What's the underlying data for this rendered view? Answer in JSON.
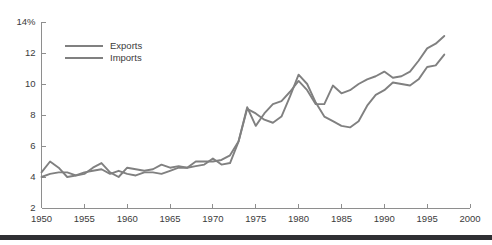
{
  "chart_data": {
    "type": "line",
    "title": "",
    "subtitle": "",
    "xlabel": "",
    "ylabel": "",
    "yunit": "%",
    "xlim": [
      1950,
      2000
    ],
    "ylim": [
      2,
      14
    ],
    "yticks": [
      2,
      4,
      6,
      8,
      10,
      12,
      14
    ],
    "ytick_labels": [
      "2",
      "4",
      "6",
      "8",
      "10",
      "12",
      "14%"
    ],
    "xticks": [
      1950,
      1955,
      1960,
      1965,
      1970,
      1975,
      1980,
      1985,
      1990,
      1995,
      2000
    ],
    "xtick_labels": [
      "1950",
      "1955",
      "1960",
      "1965",
      "1970",
      "1975",
      "1980",
      "1985",
      "1990",
      "1995",
      "2000"
    ],
    "grid": false,
    "legend_position": "top-left-inside",
    "x": [
      1950,
      1951,
      1952,
      1953,
      1954,
      1955,
      1956,
      1957,
      1958,
      1959,
      1960,
      1961,
      1962,
      1963,
      1964,
      1965,
      1966,
      1967,
      1968,
      1969,
      1970,
      1971,
      1972,
      1973,
      1974,
      1975,
      1976,
      1977,
      1978,
      1979,
      1980,
      1981,
      1982,
      1983,
      1984,
      1985,
      1986,
      1987,
      1988,
      1989,
      1990,
      1991,
      1992,
      1993,
      1994,
      1995,
      1996,
      1997
    ],
    "series": [
      {
        "name": "Exports",
        "color": "#808080",
        "values": [
          4.3,
          5.0,
          4.6,
          4.0,
          4.1,
          4.2,
          4.6,
          4.9,
          4.3,
          4.0,
          4.6,
          4.5,
          4.4,
          4.5,
          4.8,
          4.6,
          4.7,
          4.6,
          4.7,
          4.8,
          5.2,
          4.8,
          4.9,
          6.3,
          8.4,
          8.1,
          7.7,
          7.5,
          7.9,
          9.2,
          10.6,
          10.0,
          8.8,
          7.9,
          7.6,
          7.3,
          7.2,
          7.6,
          8.6,
          9.3,
          9.6,
          10.1,
          10.0,
          9.9,
          10.3,
          11.1,
          11.2,
          11.9
        ]
      },
      {
        "name": "Imports",
        "color": "#808080",
        "values": [
          4.0,
          4.2,
          4.3,
          4.3,
          4.1,
          4.3,
          4.4,
          4.5,
          4.2,
          4.4,
          4.2,
          4.1,
          4.3,
          4.3,
          4.2,
          4.4,
          4.6,
          4.6,
          5.0,
          5.0,
          5.0,
          5.1,
          5.4,
          6.3,
          8.5,
          7.3,
          8.1,
          8.7,
          8.9,
          9.5,
          10.2,
          9.6,
          8.7,
          8.7,
          9.9,
          9.4,
          9.6,
          10.0,
          10.3,
          10.5,
          10.8,
          10.4,
          10.5,
          10.8,
          11.5,
          12.3,
          12.6,
          13.1
        ]
      }
    ]
  },
  "legend": {
    "items": [
      {
        "label": "Exports"
      },
      {
        "label": "Imports"
      }
    ]
  },
  "colors": {
    "line": "#808080",
    "axis": "#8e8e8e",
    "text": "#3b3b3b",
    "background": "#ffffff",
    "bottom_bar": "#2f2f33"
  }
}
